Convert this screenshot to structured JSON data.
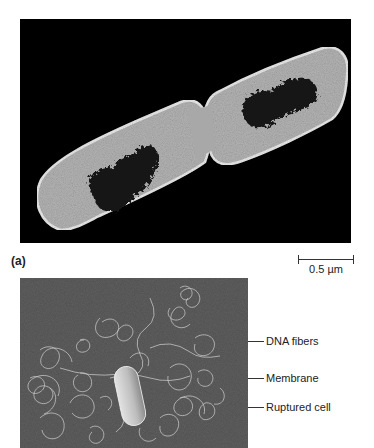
{
  "figure": {
    "panel_a": {
      "label": "(a)",
      "description": "Transmission electron micrograph of a dividing rod-shaped bacterial cell with dark nucleoid regions",
      "scale_bar": {
        "text": "0.5 µm"
      },
      "colors": {
        "background": "#000000",
        "cytoplasm": "#a8a8a8",
        "nucleoid": "#151515",
        "envelope": "#e6e6e6"
      }
    },
    "panel_b": {
      "description": "Electron micrograph of a ruptured bacterial cell releasing DNA fibers",
      "callouts": [
        {
          "text": "DNA fibers"
        },
        {
          "text": "Membrane"
        },
        {
          "text": "Ruptured cell"
        }
      ],
      "colors": {
        "background": "#4f4f4f",
        "fibers": "#cfcfcf",
        "cell": "#c8c8c8"
      }
    }
  }
}
